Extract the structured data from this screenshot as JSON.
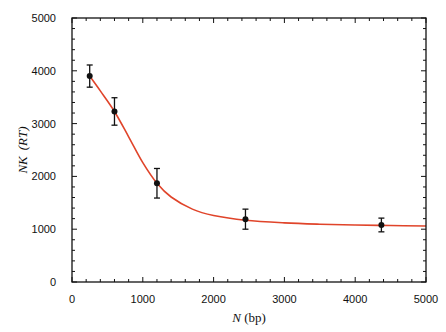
{
  "chart_data": {
    "type": "scatter",
    "title": "",
    "xlabel": "N (bp)",
    "xlabel_italic_part": "N",
    "xlabel_rest": " (bp)",
    "ylabel": "NK (RT)",
    "ylabel_italic_part": "NK",
    "ylabel_rest": "(RT)",
    "xlim": [
      0,
      5000
    ],
    "ylim": [
      0,
      5000
    ],
    "x_ticks": [
      0,
      1000,
      2000,
      3000,
      4000,
      5000
    ],
    "y_ticks": [
      0,
      1000,
      2000,
      3000,
      4000,
      5000
    ],
    "x_tick_labels": [
      "0",
      "1000",
      "2000",
      "3000",
      "4000",
      "5000"
    ],
    "y_tick_labels": [
      "0",
      "1000",
      "2000",
      "3000",
      "4000",
      "5000"
    ],
    "minor_tick_step": 200,
    "grid": false,
    "legend": null,
    "series": [
      {
        "name": "measured",
        "style": "points-with-error-bars",
        "color": "#111111",
        "x": [
          250,
          600,
          1200,
          2450,
          4370
        ],
        "y": [
          3900,
          3230,
          1870,
          1190,
          1080
        ],
        "yerr": [
          210,
          260,
          280,
          190,
          130
        ]
      },
      {
        "name": "fit",
        "style": "line",
        "color": "#e0442a",
        "x": [
          250,
          400,
          600,
          800,
          1000,
          1200,
          1400,
          1700,
          2000,
          2450,
          3000,
          3500,
          4000,
          4500,
          5000
        ],
        "y": [
          3900,
          3620,
          3230,
          2750,
          2260,
          1870,
          1610,
          1380,
          1260,
          1170,
          1120,
          1095,
          1080,
          1070,
          1060
        ]
      }
    ]
  }
}
